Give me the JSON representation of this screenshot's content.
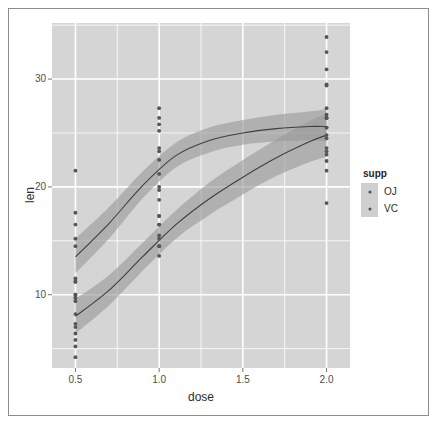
{
  "chart_data": {
    "type": "scatter",
    "title": "",
    "xlabel": "dose",
    "ylabel": "len",
    "xlim": [
      0.36,
      2.14
    ],
    "ylim": [
      3.2,
      35.2
    ],
    "xticks": [
      0.5,
      1.0,
      1.5,
      2.0
    ],
    "xticklabels": [
      "0.5",
      "1.0",
      "1.5",
      "2.0"
    ],
    "yticks": [
      10,
      20,
      30
    ],
    "yticklabels": [
      "10",
      "20",
      "30"
    ],
    "grid": true,
    "panel_background": "#d5d5d5",
    "grid_color": "#ffffff",
    "legend": {
      "position": "right",
      "title": "supp",
      "entries": [
        {
          "label": "OJ",
          "color": "#4d4d4d",
          "key_background": "#cfcfcf"
        },
        {
          "label": "VC",
          "color": "#4d4d4d",
          "key_background": "#cfcfcf"
        }
      ]
    },
    "series": [
      {
        "name": "OJ",
        "point_color": "#555555",
        "line_color": "#3f3f3f",
        "ribbon_color": "#9a9a9a",
        "x": [
          0.5,
          0.5,
          0.5,
          0.5,
          0.5,
          0.5,
          0.5,
          0.5,
          0.5,
          0.5,
          1.0,
          1.0,
          1.0,
          1.0,
          1.0,
          1.0,
          1.0,
          1.0,
          1.0,
          1.0,
          2.0,
          2.0,
          2.0,
          2.0,
          2.0,
          2.0,
          2.0,
          2.0,
          2.0,
          2.0
        ],
        "y": [
          15.2,
          21.5,
          17.6,
          9.7,
          14.5,
          10.0,
          8.2,
          9.4,
          16.5,
          9.7,
          19.7,
          23.3,
          23.6,
          26.4,
          20.0,
          25.2,
          25.8,
          21.2,
          14.5,
          27.3,
          25.5,
          26.4,
          22.4,
          24.5,
          24.8,
          30.9,
          26.4,
          27.3,
          29.4,
          23.0
        ],
        "smooth_x": [
          0.5,
          0.7,
          0.9,
          1.1,
          1.3,
          1.5,
          1.7,
          1.9,
          2.0
        ],
        "smooth_y": [
          13.5,
          16.6,
          20.1,
          22.9,
          24.3,
          25.0,
          25.4,
          25.6,
          25.6
        ],
        "smooth_lower": [
          12.0,
          15.2,
          18.9,
          21.8,
          23.2,
          23.9,
          24.2,
          24.3,
          24.2
        ],
        "smooth_upper": [
          15.2,
          18.1,
          21.4,
          24.1,
          25.5,
          26.2,
          26.7,
          27.0,
          27.2
        ]
      },
      {
        "name": "VC",
        "point_color": "#555555",
        "line_color": "#3f3f3f",
        "ribbon_color": "#9a9a9a",
        "x": [
          0.5,
          0.5,
          0.5,
          0.5,
          0.5,
          0.5,
          0.5,
          0.5,
          0.5,
          0.5,
          1.0,
          1.0,
          1.0,
          1.0,
          1.0,
          1.0,
          1.0,
          1.0,
          1.0,
          1.0,
          2.0,
          2.0,
          2.0,
          2.0,
          2.0,
          2.0,
          2.0,
          2.0,
          2.0,
          2.0
        ],
        "y": [
          4.2,
          11.5,
          7.3,
          5.8,
          6.4,
          10.0,
          11.2,
          11.2,
          5.2,
          7.0,
          16.5,
          16.5,
          15.2,
          17.3,
          22.5,
          17.3,
          13.6,
          14.5,
          18.8,
          15.5,
          23.6,
          18.5,
          33.9,
          25.5,
          26.4,
          32.5,
          26.7,
          21.5,
          23.3,
          29.5
        ],
        "smooth_x": [
          0.5,
          0.7,
          0.9,
          1.1,
          1.3,
          1.5,
          1.7,
          1.9,
          2.0
        ],
        "smooth_y": [
          8.0,
          10.4,
          13.5,
          16.5,
          18.9,
          20.9,
          22.7,
          24.2,
          24.8
        ],
        "smooth_lower": [
          6.4,
          9.0,
          12.2,
          15.2,
          17.4,
          19.3,
          21.0,
          22.3,
          22.8
        ],
        "smooth_upper": [
          9.6,
          11.8,
          14.8,
          17.8,
          20.4,
          22.5,
          24.4,
          26.1,
          26.8
        ]
      }
    ]
  }
}
